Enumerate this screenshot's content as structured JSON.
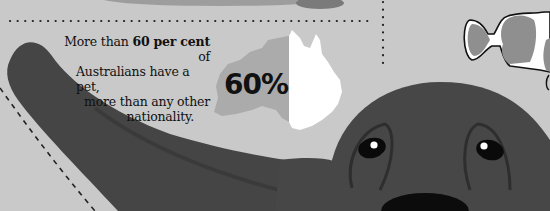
{
  "fact": {
    "line1_pre": "More than ",
    "line1_bold": "60 per cent",
    "line1_post": " of",
    "line2": "Australians have a pet,",
    "line3": "more than any other",
    "line4": "nationality."
  },
  "stat": {
    "value": "60%"
  },
  "colors": {
    "background": "#c9c9c9",
    "dog": "#444444",
    "map_grey": "#aaaaaa",
    "map_white": "#ffffff",
    "fish_grey": "#8f8f8f"
  }
}
